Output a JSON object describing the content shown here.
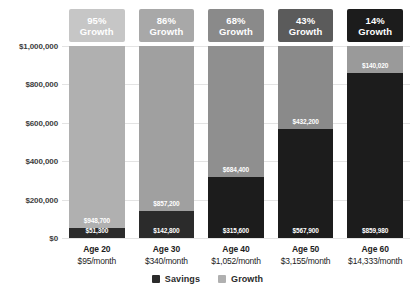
{
  "chart_data": {
    "type": "bar",
    "subtype": "stacked-bar",
    "title": "",
    "xlabel": "",
    "ylabel": "",
    "ylim": [
      0,
      1000000
    ],
    "grid": true,
    "legend_position": "bottom-center",
    "categories": [
      "Age 20",
      "Age 30",
      "Age 40",
      "Age 50",
      "Age 60"
    ],
    "ytick_labels": [
      "$1,000,000",
      "$800,000",
      "$600,000",
      "$400,000",
      "$200,000",
      "$0"
    ],
    "ytick_values": [
      1000000,
      800000,
      600000,
      400000,
      200000,
      0
    ],
    "series": [
      {
        "name": "Savings",
        "values": [
          51300,
          142800,
          315600,
          567900,
          859980
        ],
        "value_labels": [
          "$51,300",
          "$142,800",
          "$315,600",
          "$567,900",
          "$859,980"
        ]
      },
      {
        "name": "Growth",
        "values": [
          948700,
          857200,
          684400,
          432200,
          140020
        ],
        "value_labels": [
          "$948,700",
          "$857,200",
          "$684,400",
          "$432,200",
          "$140,020"
        ]
      }
    ],
    "totals": [
      1000000,
      1000000,
      1000000,
      1000000,
      1000000
    ],
    "bar_badges": [
      "95%",
      "86%",
      "68%",
      "43%",
      "14%"
    ],
    "badge_suffix": "Growth",
    "sublabels": [
      "$95/month",
      "$340/month",
      "$1,052/month",
      "$3,155/month",
      "$14,333/month"
    ],
    "badge_colors": [
      "#c6c6c6",
      "#a8a8a8",
      "#8a8a8a",
      "#5b5b5b",
      "#1c1c1c"
    ],
    "savings_colors": [
      "#2b2b2b",
      "#2b2b2b",
      "#1c1c1c",
      "#1c1c1c",
      "#1c1c1c"
    ],
    "growth_colors": [
      "#b0b0b0",
      "#a0a0a0",
      "#8f8f8f",
      "#8a8a8a",
      "#9a9a9a"
    ]
  },
  "legend": {
    "items": [
      {
        "label": "Savings",
        "color": "#2b2b2b"
      },
      {
        "label": "Growth",
        "color": "#b0b0b0"
      }
    ]
  }
}
